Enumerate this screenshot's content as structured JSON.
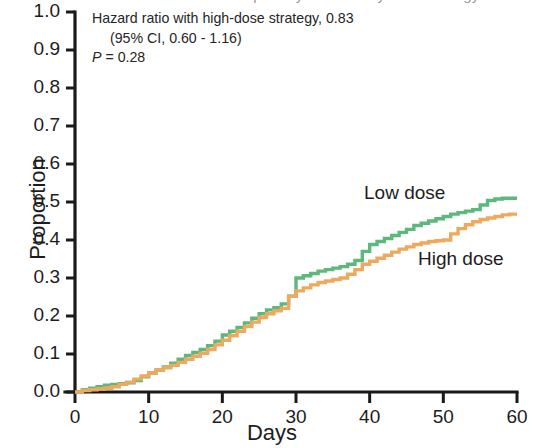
{
  "figure": {
    "clipped_title": "Cumulative incidence of the primary outcome by dose strategy",
    "annotation": {
      "line1": "Hazard ratio with high-dose strategy, 0.83",
      "line2": "(95% CI, 0.60 - 1.16)",
      "line3_p_italic": "P",
      "line3_rest": " = 0.28"
    }
  },
  "chart_data": {
    "type": "line",
    "subtype": "step",
    "title": "",
    "xlabel": "Days",
    "ylabel": "Proportion",
    "xlim": [
      0,
      60
    ],
    "ylim": [
      0.0,
      1.0
    ],
    "xticks": [
      0,
      10,
      20,
      30,
      40,
      50,
      60
    ],
    "xtick_labels": [
      "0",
      "10",
      "20",
      "30",
      "40",
      "50",
      "60"
    ],
    "yticks": [
      0.0,
      0.1,
      0.2,
      0.3,
      0.4,
      0.5,
      0.6,
      0.7,
      0.8,
      0.9,
      1.0
    ],
    "ytick_labels": [
      "0.0",
      "0.1",
      "0.2",
      "0.3",
      "0.4",
      "0.5",
      "0.6",
      "0.7",
      "0.8",
      "0.9",
      "1.0"
    ],
    "grid": false,
    "legend_position": "inline-curve-labels",
    "series": [
      {
        "name": "Low dose",
        "color": "#5cb87c",
        "label_x": 364,
        "label_y": 182,
        "x": [
          0,
          1,
          2,
          3,
          4,
          5,
          6,
          7,
          8,
          9,
          10,
          11,
          12,
          13,
          14,
          15,
          16,
          17,
          18,
          19,
          20,
          21,
          22,
          23,
          24,
          25,
          26,
          27,
          28,
          29,
          30,
          31,
          32,
          33,
          34,
          35,
          36,
          37,
          38,
          39,
          40,
          41,
          42,
          43,
          44,
          45,
          46,
          47,
          48,
          49,
          50,
          51,
          52,
          53,
          54,
          55,
          56,
          57,
          58,
          59,
          60
        ],
        "y": [
          0.0,
          0.006,
          0.01,
          0.014,
          0.018,
          0.02,
          0.022,
          0.024,
          0.03,
          0.04,
          0.05,
          0.058,
          0.066,
          0.076,
          0.086,
          0.096,
          0.104,
          0.112,
          0.122,
          0.134,
          0.15,
          0.16,
          0.17,
          0.182,
          0.194,
          0.206,
          0.216,
          0.222,
          0.232,
          0.252,
          0.3,
          0.306,
          0.312,
          0.318,
          0.322,
          0.326,
          0.33,
          0.336,
          0.346,
          0.37,
          0.388,
          0.396,
          0.404,
          0.412,
          0.42,
          0.428,
          0.438,
          0.444,
          0.45,
          0.456,
          0.462,
          0.468,
          0.472,
          0.476,
          0.48,
          0.492,
          0.504,
          0.508,
          0.51,
          0.51,
          0.51
        ]
      },
      {
        "name": "High dose",
        "color": "#edaa5e",
        "label_x": 418,
        "label_y": 248,
        "x": [
          0,
          1,
          2,
          3,
          4,
          5,
          6,
          7,
          8,
          9,
          10,
          11,
          12,
          13,
          14,
          15,
          16,
          17,
          18,
          19,
          20,
          21,
          22,
          23,
          24,
          25,
          26,
          27,
          28,
          29,
          30,
          31,
          32,
          33,
          34,
          35,
          36,
          37,
          38,
          39,
          40,
          41,
          42,
          43,
          44,
          45,
          46,
          47,
          48,
          49,
          50,
          51,
          52,
          53,
          54,
          55,
          56,
          57,
          58,
          59,
          60
        ],
        "y": [
          0.0,
          0.004,
          0.006,
          0.008,
          0.01,
          0.014,
          0.02,
          0.026,
          0.034,
          0.042,
          0.05,
          0.058,
          0.064,
          0.07,
          0.078,
          0.086,
          0.094,
          0.102,
          0.112,
          0.124,
          0.136,
          0.148,
          0.16,
          0.172,
          0.184,
          0.196,
          0.206,
          0.214,
          0.22,
          0.252,
          0.266,
          0.274,
          0.282,
          0.288,
          0.292,
          0.296,
          0.3,
          0.31,
          0.322,
          0.336,
          0.344,
          0.352,
          0.36,
          0.368,
          0.376,
          0.382,
          0.388,
          0.392,
          0.396,
          0.398,
          0.4,
          0.416,
          0.43,
          0.44,
          0.448,
          0.454,
          0.458,
          0.462,
          0.466,
          0.468,
          0.468
        ]
      }
    ],
    "axes_geometry": {
      "plot_left_px": 75,
      "plot_right_px": 517,
      "plot_top_px": 12,
      "plot_bottom_px": 392
    }
  }
}
